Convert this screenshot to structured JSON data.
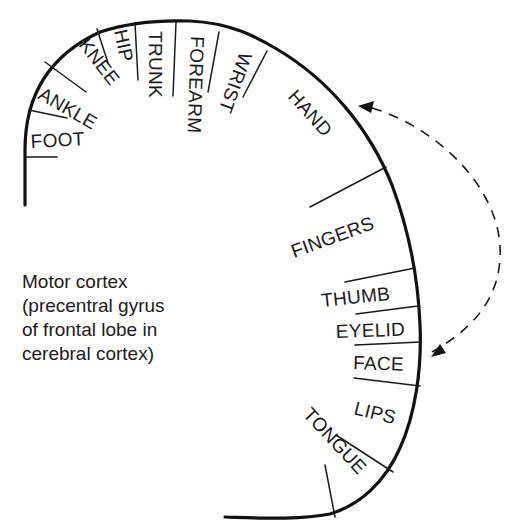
{
  "diagram": {
    "caption_lines": [
      "Motor cortex",
      "(precentral gyrus",
      "of frontal lobe in",
      "cerebral cortex)"
    ],
    "regions": [
      {
        "id": "foot",
        "label": "FOOT"
      },
      {
        "id": "ankle",
        "label": "ANKLE"
      },
      {
        "id": "knee",
        "label": "KNEE"
      },
      {
        "id": "hip",
        "label": "HIP"
      },
      {
        "id": "trunk",
        "label": "TRUNK"
      },
      {
        "id": "forearm",
        "label": "FOREARM"
      },
      {
        "id": "wrist",
        "label": "WRIST"
      },
      {
        "id": "hand",
        "label": "HAND"
      },
      {
        "id": "fingers",
        "label": "FINGERS"
      },
      {
        "id": "thumb",
        "label": "THUMB"
      },
      {
        "id": "eyelid",
        "label": "EYELID"
      },
      {
        "id": "face",
        "label": "FACE"
      },
      {
        "id": "lips",
        "label": "LIPS"
      },
      {
        "id": "tongue",
        "label": "TONGUE"
      }
    ],
    "connector": {
      "style": "dashed bidirectional arrow",
      "from": "HAND",
      "to": "FACE"
    },
    "colors": {
      "background": "#ffffff",
      "ink": "#111111"
    }
  }
}
